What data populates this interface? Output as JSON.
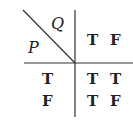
{
  "truth_table": {
    "row_variable": "P",
    "column_variable": "Q",
    "column_headers": [
      "T",
      "F"
    ],
    "row_headers": [
      "T",
      "F"
    ],
    "cells": [
      [
        "T",
        "T"
      ],
      [
        "T",
        "F"
      ]
    ]
  }
}
